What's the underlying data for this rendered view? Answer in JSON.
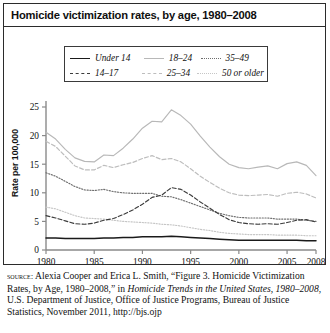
{
  "figure": {
    "title": "Homicide victimization rates, by age, 1980–2008"
  },
  "legend": {
    "entries": [
      {
        "label": "Under 14",
        "style": "solid",
        "color": "#1a1a1a",
        "width": 1.5
      },
      {
        "label": "14–17",
        "style": "dashed",
        "color": "#3c3c3c",
        "width": 1.2
      },
      {
        "label": "18–24",
        "style": "solid",
        "color": "#b8b8b8",
        "width": 1.2
      },
      {
        "label": "25–34",
        "style": "dashed",
        "color": "#bdbdbd",
        "width": 1.2
      },
      {
        "label": "35–49",
        "style": "dotted",
        "color": "#6e6e6e",
        "width": 1.2
      },
      {
        "label": "50 or older",
        "style": "dotted",
        "color": "#c6c6c6",
        "width": 1.2
      }
    ]
  },
  "axes": {
    "y_title": "Rate per 100,000",
    "y_ticks": [
      "0",
      "5",
      "10",
      "15",
      "20",
      "25"
    ],
    "x_ticks": [
      "1980",
      "1985",
      "1990",
      "1995",
      "2000",
      "2005",
      "2008"
    ]
  },
  "source": {
    "label": "source:",
    "text_1": " Alexia Cooper and Erica L. Smith, “Figure 3. Homicide Victimization Rates, by Age, 1980–2008,” in ",
    "italic_1": "Homicide Trends in the United States, 1980–2008",
    "text_2": ", U.S. Department of Justice, Office of Justice Programs, Bureau of Justice Statistics, November 2011, http://bjs.ojp"
  },
  "chart_data": {
    "type": "line",
    "title": "Homicide victimization rates, by age, 1980–2008",
    "xlabel": "",
    "ylabel": "Rate per 100,000",
    "xlim": [
      1980,
      2008
    ],
    "ylim": [
      0,
      25
    ],
    "grid": false,
    "legend_position": "above-plot",
    "x": [
      1980,
      1981,
      1982,
      1983,
      1984,
      1985,
      1986,
      1987,
      1988,
      1989,
      1990,
      1991,
      1992,
      1993,
      1994,
      1995,
      1996,
      1997,
      1998,
      1999,
      2000,
      2001,
      2002,
      2003,
      2004,
      2005,
      2006,
      2007,
      2008
    ],
    "series": [
      {
        "name": "Under 14",
        "style": "solid",
        "color": "#1a1a1a",
        "values": [
          2.1,
          2.1,
          2.0,
          2.0,
          2.0,
          2.0,
          2.1,
          2.1,
          2.2,
          2.2,
          2.3,
          2.3,
          2.3,
          2.4,
          2.3,
          2.2,
          2.1,
          2.0,
          1.9,
          1.8,
          1.7,
          1.7,
          1.7,
          1.7,
          1.7,
          1.7,
          1.7,
          1.6,
          1.6
        ]
      },
      {
        "name": "14–17",
        "style": "dashed",
        "color": "#3c3c3c",
        "values": [
          6.0,
          5.6,
          5.1,
          4.6,
          4.5,
          4.7,
          5.2,
          5.5,
          6.2,
          7.0,
          8.0,
          9.2,
          9.6,
          10.9,
          10.6,
          9.6,
          8.4,
          7.3,
          6.2,
          5.3,
          4.8,
          4.6,
          4.5,
          4.6,
          4.5,
          4.8,
          5.2,
          5.3,
          4.9
        ]
      },
      {
        "name": "18–24",
        "style": "solid",
        "color": "#b8b8b8",
        "values": [
          20.6,
          19.4,
          17.6,
          16.1,
          15.5,
          15.4,
          16.6,
          16.5,
          17.8,
          19.4,
          21.3,
          22.5,
          22.4,
          24.5,
          23.5,
          22.0,
          19.9,
          18.0,
          16.3,
          15.0,
          14.4,
          14.2,
          14.5,
          14.7,
          14.2,
          15.1,
          15.4,
          14.8,
          13.0
        ]
      },
      {
        "name": "25–34",
        "style": "dashed",
        "color": "#bdbdbd",
        "values": [
          19.0,
          18.1,
          16.4,
          14.7,
          14.0,
          14.0,
          14.8,
          14.4,
          14.9,
          15.3,
          16.0,
          16.5,
          15.8,
          16.0,
          15.4,
          14.2,
          12.9,
          11.8,
          10.8,
          10.0,
          9.6,
          9.5,
          9.6,
          9.7,
          9.4,
          9.9,
          10.1,
          9.8,
          9.1
        ]
      },
      {
        "name": "35–49",
        "style": "dotted",
        "color": "#6e6e6e",
        "values": [
          13.5,
          12.9,
          12.0,
          11.1,
          10.5,
          10.4,
          10.6,
          10.2,
          10.0,
          9.9,
          9.9,
          9.9,
          9.4,
          9.3,
          8.8,
          8.2,
          7.6,
          7.0,
          6.4,
          6.0,
          5.7,
          5.6,
          5.6,
          5.6,
          5.4,
          5.4,
          5.4,
          5.2,
          5.0
        ]
      },
      {
        "name": "50 or older",
        "style": "dotted",
        "color": "#c6c6c6",
        "values": [
          7.5,
          7.2,
          6.6,
          6.0,
          5.6,
          5.5,
          5.4,
          5.2,
          5.0,
          4.9,
          4.8,
          4.7,
          4.5,
          4.4,
          4.2,
          3.9,
          3.6,
          3.4,
          3.1,
          2.9,
          2.8,
          2.7,
          2.7,
          2.7,
          2.6,
          2.6,
          2.6,
          2.5,
          2.5
        ]
      }
    ]
  }
}
